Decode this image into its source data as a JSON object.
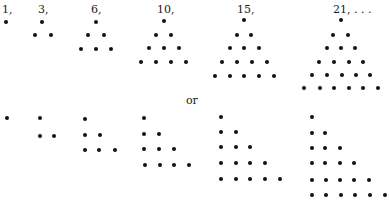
{
  "figure": {
    "dot_color": "#111111",
    "separator": {
      "text": "or",
      "x": 186,
      "y": 95
    },
    "top_row": {
      "arrangement": "triangle",
      "groups": [
        {
          "label": "1,",
          "label_x": 2,
          "label_y": 4,
          "rows": [
            {
              "y": 22,
              "xs": [
                6
              ]
            }
          ]
        },
        {
          "label": "3,",
          "label_x": 38,
          "label_y": 4,
          "rows": [
            {
              "y": 22,
              "xs": [
                42
              ]
            },
            {
              "y": 35,
              "xs": [
                35,
                51
              ]
            }
          ]
        },
        {
          "label": "6,",
          "label_x": 91,
          "label_y": 4,
          "rows": [
            {
              "y": 22,
              "xs": [
                96
              ]
            },
            {
              "y": 35,
              "xs": [
                88,
                104
              ]
            },
            {
              "y": 49,
              "xs": [
                81,
                96,
                111
              ]
            }
          ]
        },
        {
          "label": "10,",
          "label_x": 157,
          "label_y": 4,
          "rows": [
            {
              "y": 21,
              "xs": [
                164
              ]
            },
            {
              "y": 35,
              "xs": [
                156,
                171
              ]
            },
            {
              "y": 48,
              "xs": [
                149,
                164,
                179
              ]
            },
            {
              "y": 62,
              "xs": [
                141,
                156,
                171,
                186
              ]
            }
          ]
        },
        {
          "label": "15,",
          "label_x": 237,
          "label_y": 4,
          "rows": [
            {
              "y": 20,
              "xs": [
                244
              ]
            },
            {
              "y": 35,
              "xs": [
                237,
                251
              ]
            },
            {
              "y": 48,
              "xs": [
                230,
                244,
                259
              ]
            },
            {
              "y": 62,
              "xs": [
                222,
                237,
                252,
                267
              ]
            },
            {
              "y": 76,
              "xs": [
                215,
                230,
                244,
                259,
                274
              ]
            }
          ]
        },
        {
          "label": "21, . . .",
          "label_x": 333,
          "label_y": 4,
          "rows": [
            {
              "y": 20,
              "xs": [
                341
              ]
            },
            {
              "y": 35,
              "xs": [
                333,
                348
              ]
            },
            {
              "y": 48,
              "xs": [
                327,
                341,
                355
              ]
            },
            {
              "y": 62,
              "xs": [
                319,
                334,
                349,
                363
              ]
            },
            {
              "y": 75,
              "xs": [
                312,
                327,
                342,
                356,
                370
              ]
            },
            {
              "y": 88,
              "xs": [
                304,
                320,
                334,
                349,
                363,
                378
              ]
            }
          ]
        }
      ]
    },
    "bottom_row": {
      "arrangement": "staircase",
      "groups": [
        {
          "rows": [
            {
              "y": 118,
              "xs": [
                7
              ]
            }
          ]
        },
        {
          "rows": [
            {
              "y": 118,
              "xs": [
                40
              ]
            },
            {
              "y": 136,
              "xs": [
                40,
                54
              ]
            }
          ]
        },
        {
          "rows": [
            {
              "y": 119,
              "xs": [
                85
              ]
            },
            {
              "y": 135,
              "xs": [
                85,
                100
              ]
            },
            {
              "y": 150,
              "xs": [
                85,
                99,
                115
              ]
            }
          ]
        },
        {
          "rows": [
            {
              "y": 118,
              "xs": [
                144
              ]
            },
            {
              "y": 134,
              "xs": [
                144,
                159
              ]
            },
            {
              "y": 149,
              "xs": [
                144,
                159,
                174
              ]
            },
            {
              "y": 165,
              "xs": [
                145,
                160,
                174,
                189
              ]
            }
          ]
        },
        {
          "rows": [
            {
              "y": 117,
              "xs": [
                221
              ]
            },
            {
              "y": 132,
              "xs": [
                221,
                236
              ]
            },
            {
              "y": 147,
              "xs": [
                221,
                236,
                250
              ]
            },
            {
              "y": 163,
              "xs": [
                221,
                236,
                250,
                265
              ]
            },
            {
              "y": 179,
              "xs": [
                221,
                236,
                250,
                265,
                280
              ]
            }
          ]
        },
        {
          "rows": [
            {
              "y": 117,
              "xs": [
                312
              ]
            },
            {
              "y": 133,
              "xs": [
                312,
                325
              ]
            },
            {
              "y": 148,
              "xs": [
                312,
                325,
                340
              ]
            },
            {
              "y": 163,
              "xs": [
                312,
                325,
                340,
                354
              ]
            },
            {
              "y": 180,
              "xs": [
                312,
                326,
                340,
                354,
                369
              ]
            },
            {
              "y": 195,
              "xs": [
                312,
                326,
                341,
                355,
                370,
                385
              ]
            }
          ]
        }
      ]
    }
  }
}
